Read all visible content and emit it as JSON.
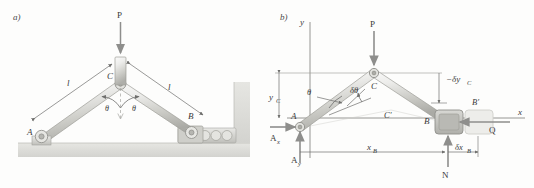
{
  "figure": {
    "type": "statics-free-body-diagram",
    "panels": [
      {
        "tag": "a)",
        "description": "Two-bar toggle mechanism: pin support at A, roller at B, vertical load P applied at apex C",
        "labels": {
          "load": "P",
          "apex": "C",
          "pin": "A",
          "roller": "B",
          "length_left": "l",
          "length_right": "l",
          "angle_left": "θ",
          "angle_right": "θ"
        }
      },
      {
        "tag": "b)",
        "description": "Virtual work diagram with coordinate axes, reactions and virtual displacements",
        "labels": {
          "axis_y": "y",
          "axis_x": "x",
          "load": "P",
          "apex": "C",
          "apex_virtual": "C′",
          "pin": "A",
          "roller": "B",
          "roller_virtual": "B′",
          "reaction_ax": "A",
          "reaction_ax_sub": "x",
          "reaction_ay": "A",
          "reaction_ay_sub": "y",
          "normal_force": "N",
          "applied_force": "Q",
          "angle": "θ",
          "virtual_angle": "δθ",
          "height_yc": "y",
          "height_yc_sub": "C",
          "virtual_dy": "−δy",
          "virtual_dy_sub": "C",
          "distance_xb": "x",
          "distance_xb_sub": "B",
          "virtual_dx": "δx",
          "virtual_dx_sub": "B"
        }
      }
    ]
  },
  "colors": {
    "background": "#fdfdfc",
    "ink": "#3a3a3a",
    "bar_light": "#f0f0ee",
    "bar_mid": "#d6d6d2",
    "bar_dark": "#a9a9a5",
    "ground": "#dcdcd8",
    "arrow": "#8c8c8c",
    "ghost": "#d8d8d6"
  }
}
